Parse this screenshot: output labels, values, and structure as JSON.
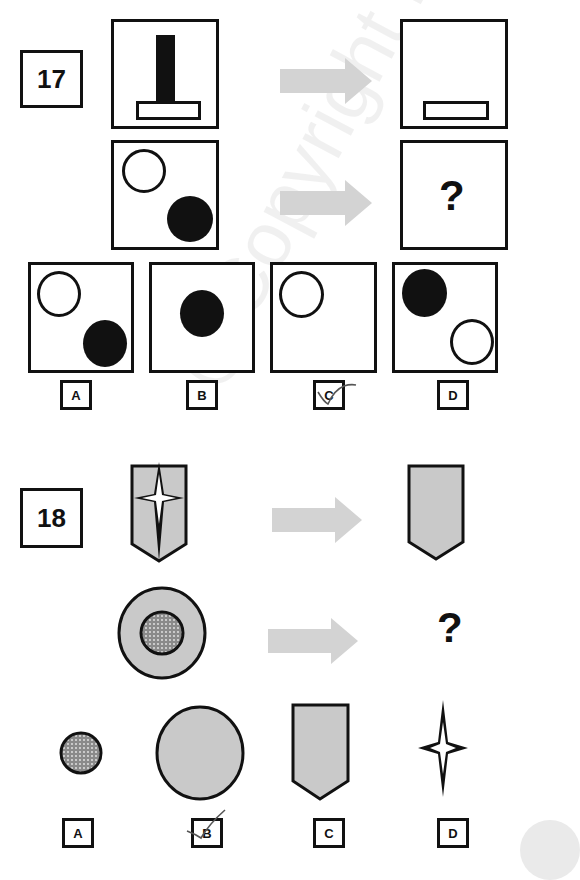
{
  "questions": [
    {
      "number": "17",
      "example": {
        "input": "black-vertical-bar-on-outlined-horizontal-base",
        "output": "outlined-horizontal-base-only"
      },
      "problem": {
        "input": "open-circle-top-left-and-filled-circle-bottom-right",
        "output_placeholder": "?"
      },
      "options": [
        {
          "label": "A",
          "figure": "open-circle-top-left-and-filled-circle-bottom-right"
        },
        {
          "label": "B",
          "figure": "filled-circle-center"
        },
        {
          "label": "C",
          "figure": "open-circle-top-left",
          "marked": true
        },
        {
          "label": "D",
          "figure": "filled-circle-top-left-and-open-circle-bottom-right"
        }
      ]
    },
    {
      "number": "18",
      "example": {
        "input": "grey-shield-with-white-four-point-star",
        "output": "grey-shield"
      },
      "problem": {
        "input": "grey-circle-with-dotted-inner-circle",
        "output_placeholder": "?"
      },
      "options": [
        {
          "label": "A",
          "figure": "small-dotted-circle"
        },
        {
          "label": "B",
          "figure": "large-grey-circle",
          "marked": true
        },
        {
          "label": "C",
          "figure": "grey-shield"
        },
        {
          "label": "D",
          "figure": "four-point-star"
        }
      ]
    }
  ],
  "watermark": "@Copyright M",
  "colors": {
    "stroke": "#111111",
    "shape_fill": "#c9c9c9",
    "arrow": "#d3d3d3",
    "check_mark": "#555555"
  }
}
